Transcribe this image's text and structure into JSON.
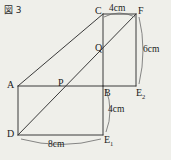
{
  "figure": {
    "title": "図 3",
    "type": "geometry-diagram",
    "stroke_color": "#3a3a3a",
    "background_color": "#efefea",
    "text_color": "#1c1c1c"
  },
  "vertices": {
    "A": {
      "label": "A",
      "x": 18,
      "y": 86
    },
    "B": {
      "label": "B",
      "x": 103,
      "y": 86
    },
    "C": {
      "label": "C",
      "x": 103,
      "y": 14
    },
    "D": {
      "label": "D",
      "x": 18,
      "y": 135
    },
    "F": {
      "label": "F",
      "x": 136,
      "y": 14
    },
    "P": {
      "label": "P",
      "x": 62,
      "y": 86
    },
    "Q": {
      "label": "Q",
      "x": 103,
      "y": 50
    },
    "E1": {
      "label": "E",
      "sub": "1",
      "x": 103,
      "y": 135
    },
    "E2": {
      "label": "E",
      "sub": "2",
      "x": 136,
      "y": 86
    }
  },
  "dimensions": [
    {
      "name": "top-width",
      "value": "4cm",
      "edge": "C-F"
    },
    {
      "name": "right-height",
      "value": "6cm",
      "edge": "F-E2"
    },
    {
      "name": "mid-right-height",
      "value": "4cm",
      "edge": "B-E1"
    },
    {
      "name": "bottom-width",
      "value": "8cm",
      "edge": "D-E1"
    }
  ],
  "labels": {
    "A": "A",
    "B": "B",
    "C": "C",
    "D": "D",
    "F": "F",
    "P": "P",
    "Q": "Q",
    "E1_base": "E",
    "E1_sub": "1",
    "E2_base": "E",
    "E2_sub": "2",
    "dim_top": "4cm",
    "dim_right": "6cm",
    "dim_mid": "4cm",
    "dim_bottom": "8cm"
  }
}
